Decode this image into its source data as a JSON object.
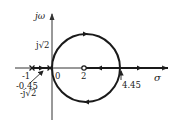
{
  "diagram": {
    "type": "root-locus",
    "axes": {
      "vertical_label": "jω",
      "horizontal_label": "σ"
    },
    "markers": {
      "imag_upper": "j√2",
      "imag_lower": "-j√2",
      "pole_1_label": "-1",
      "pole_2_label": "0",
      "zero_label": "2",
      "breakaway_label": "-0.45",
      "breakin_label": "4.45"
    },
    "poles": [
      -1,
      0
    ],
    "zeros": [
      2
    ],
    "circle": {
      "center": 2,
      "radius": 2.45
    },
    "colors": {
      "line": "#1a1a1a",
      "axis": "#333333"
    }
  }
}
